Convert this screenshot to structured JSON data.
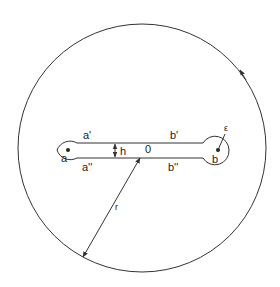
{
  "diagram": {
    "stroke_color": "#333333",
    "background": "#ffffff",
    "outer_circle": {
      "label": "r",
      "orientation": "counterclockwise"
    },
    "slit": {
      "left_end_label": "a",
      "right_end_label": "b",
      "upper_left_label": "a'",
      "lower_left_label": "a''",
      "upper_right_label": "b'",
      "lower_right_label": "b''",
      "width_label": "h",
      "center_label": "0",
      "end_radius_label": "ε"
    }
  }
}
